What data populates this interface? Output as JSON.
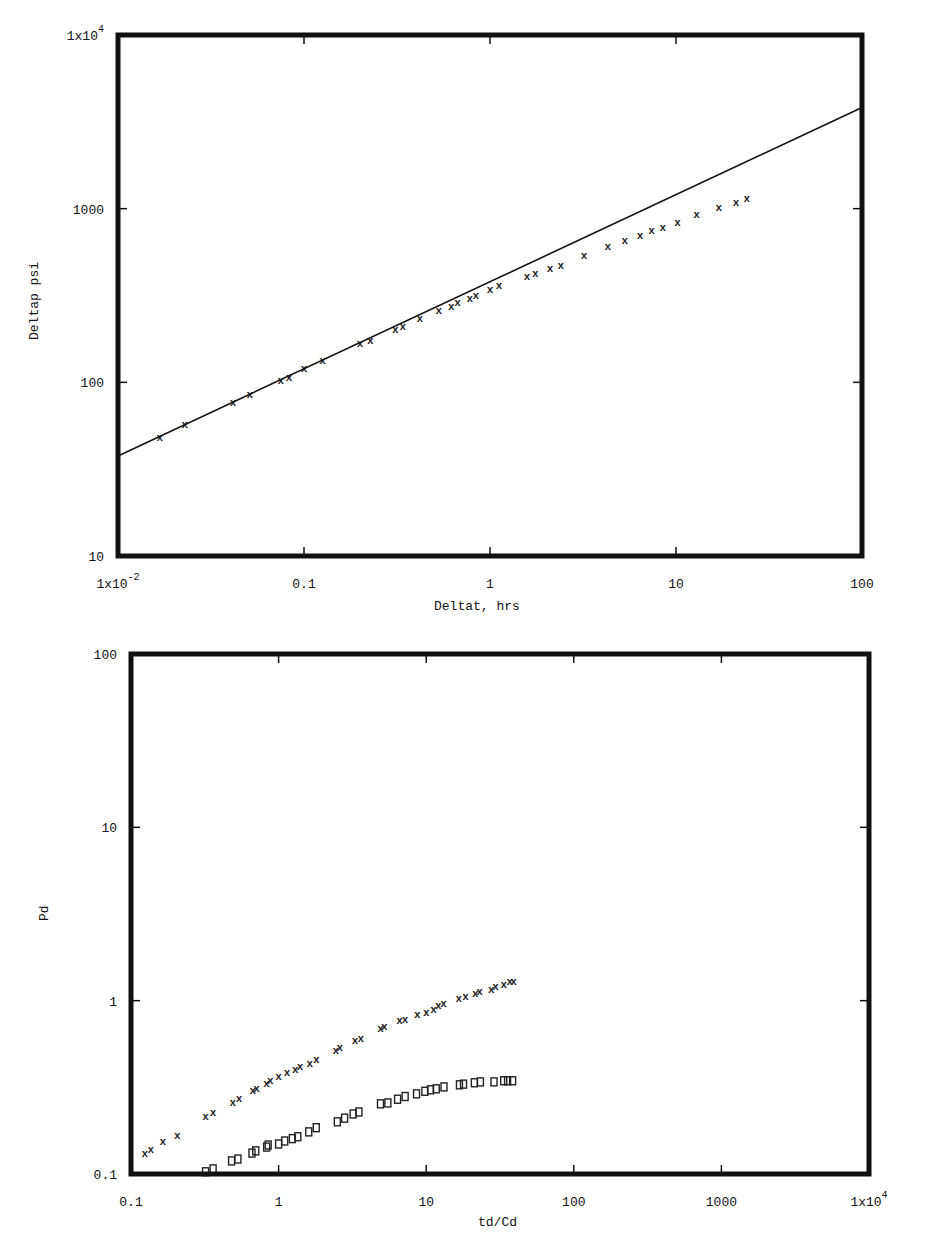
{
  "chart_data": [
    {
      "type": "scatter",
      "title": "",
      "xlabel": "Deltat, hrs",
      "ylabel": "Deltap  psi",
      "xscale": "log",
      "yscale": "log",
      "xlim": [
        0.01,
        100
      ],
      "ylim": [
        10,
        10000
      ],
      "grid": false,
      "x_tick_labels": [
        "1x10^-2",
        "0.1",
        "1",
        "10",
        "100"
      ],
      "y_tick_labels": [
        "10",
        "100",
        "1000",
        "1x10^4"
      ],
      "series": [
        {
          "name": "measured",
          "marker": "x",
          "x": [
            0.0168,
            0.0229,
            0.0416,
            0.0512,
            0.075,
            0.083,
            0.1,
            0.126,
            0.2,
            0.227,
            0.31,
            0.34,
            0.42,
            0.53,
            0.62,
            0.67,
            0.78,
            0.84,
            1.0,
            1.12,
            1.58,
            1.75,
            2.1,
            2.4,
            3.2,
            4.3,
            5.3,
            6.4,
            7.4,
            8.5,
            10.2,
            12.9,
            17.0,
            21.0,
            24.0
          ],
          "y": [
            48.5,
            57.7,
            77,
            86,
            103,
            108,
            121,
            135,
            168,
            176,
            203,
            211,
            236,
            261,
            276,
            291,
            307,
            320,
            345,
            364,
            411,
            428,
            457,
            475,
            541,
            610,
            661,
            707,
            757,
            787,
            840,
            935,
            1020,
            1095,
            1145
          ]
        },
        {
          "name": "fit line",
          "marker": "line",
          "x": [
            0.01,
            100
          ],
          "y": [
            37.7,
            3820
          ]
        }
      ]
    },
    {
      "type": "scatter",
      "title": "",
      "xlabel": "td/Cd",
      "ylabel": "Pd",
      "xscale": "log",
      "yscale": "log",
      "xlim": [
        0.1,
        10000
      ],
      "ylim": [
        0.1,
        100
      ],
      "grid": false,
      "x_tick_labels": [
        "0.1",
        "1",
        "10",
        "100",
        "1000",
        "1x10^4"
      ],
      "y_tick_labels": [
        "0.1",
        "1",
        "10",
        "100"
      ],
      "series": [
        {
          "name": "Pd (x markers)",
          "marker": "x",
          "x": [
            0.124,
            0.136,
            0.164,
            0.206,
            0.32,
            0.36,
            0.49,
            0.54,
            0.67,
            0.71,
            0.83,
            0.88,
            1.0,
            1.14,
            1.3,
            1.4,
            1.63,
            1.8,
            2.44,
            2.6,
            3.3,
            3.6,
            4.9,
            5.2,
            6.6,
            7.2,
            8.7,
            10.0,
            11.2,
            12.1,
            13.1,
            16.6,
            18.5,
            21.5,
            23.0,
            27.6,
            29.5,
            33.5,
            36.8,
            39.0
          ],
          "y": [
            0.132,
            0.14,
            0.155,
            0.168,
            0.217,
            0.228,
            0.26,
            0.275,
            0.306,
            0.315,
            0.336,
            0.35,
            0.369,
            0.389,
            0.405,
            0.42,
            0.438,
            0.46,
            0.52,
            0.54,
            0.595,
            0.61,
            0.7,
            0.717,
            0.77,
            0.78,
            0.84,
            0.86,
            0.9,
            0.95,
            0.97,
            1.04,
            1.07,
            1.1,
            1.13,
            1.17,
            1.22,
            1.24,
            1.29,
            1.29
          ]
        },
        {
          "name": "Pd derivative (square markers)",
          "marker": "square",
          "x": [
            0.32,
            0.36,
            0.48,
            0.53,
            0.66,
            0.7,
            0.83,
            0.85,
            1.0,
            1.1,
            1.24,
            1.35,
            1.6,
            1.8,
            2.5,
            2.8,
            3.2,
            3.5,
            4.9,
            5.5,
            6.4,
            7.2,
            8.6,
            9.8,
            10.7,
            11.7,
            13.2,
            16.8,
            17.9,
            21.2,
            23.3,
            28.8,
            33.5,
            35.6,
            38.5
          ],
          "y": [
            0.103,
            0.107,
            0.119,
            0.122,
            0.132,
            0.136,
            0.143,
            0.147,
            0.149,
            0.155,
            0.16,
            0.164,
            0.175,
            0.185,
            0.2,
            0.21,
            0.222,
            0.228,
            0.254,
            0.257,
            0.27,
            0.28,
            0.29,
            0.3,
            0.306,
            0.31,
            0.318,
            0.327,
            0.33,
            0.336,
            0.34,
            0.34,
            0.345,
            0.345,
            0.345
          ]
        }
      ]
    }
  ],
  "plots": {
    "top": {
      "xlabel": "Deltat, hrs",
      "ylabel": "Deltap  psi",
      "x_ticks": [
        {
          "value": 0.01,
          "label": "1x10",
          "exp": "-2"
        },
        {
          "value": 0.1,
          "label": "0.1",
          "exp": ""
        },
        {
          "value": 1,
          "label": "1",
          "exp": ""
        },
        {
          "value": 10,
          "label": "10",
          "exp": ""
        },
        {
          "value": 100,
          "label": "100",
          "exp": ""
        }
      ],
      "y_ticks": [
        {
          "value": 10,
          "label": "10",
          "exp": ""
        },
        {
          "value": 100,
          "label": "100",
          "exp": ""
        },
        {
          "value": 1000,
          "label": "1000",
          "exp": ""
        },
        {
          "value": 10000,
          "label": "1x10",
          "exp": "4"
        }
      ]
    },
    "bottom": {
      "xlabel": "td/Cd",
      "ylabel": "Pd",
      "x_ticks": [
        {
          "value": 0.1,
          "label": "0.1",
          "exp": ""
        },
        {
          "value": 1,
          "label": "1",
          "exp": ""
        },
        {
          "value": 10,
          "label": "10",
          "exp": ""
        },
        {
          "value": 100,
          "label": "100",
          "exp": ""
        },
        {
          "value": 1000,
          "label": "1000",
          "exp": ""
        },
        {
          "value": 10000,
          "label": "1x10",
          "exp": "4"
        }
      ],
      "y_ticks": [
        {
          "value": 0.1,
          "label": "0.1",
          "exp": ""
        },
        {
          "value": 1,
          "label": "1",
          "exp": ""
        },
        {
          "value": 10,
          "label": "10",
          "exp": ""
        },
        {
          "value": 100,
          "label": "100",
          "exp": ""
        }
      ]
    }
  }
}
